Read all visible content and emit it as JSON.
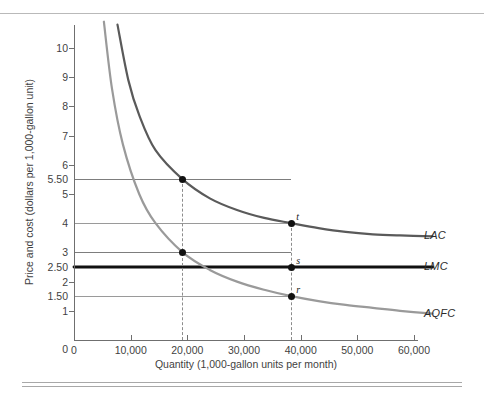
{
  "chart_data": {
    "type": "line",
    "title": "",
    "xlabel": "Quantity (1,000-gallon units per month)",
    "ylabel": "Price and cost (dollars per 1,000-gallon unit)",
    "xlim": [
      0,
      68000
    ],
    "ylim": [
      0,
      10.8
    ],
    "grid": false,
    "legend_position": "right-of-curves",
    "x_ticks": [
      {
        "value": 0,
        "label": "0"
      },
      {
        "value": 10000,
        "label": "10,000"
      },
      {
        "value": 20000,
        "label": "20,000"
      },
      {
        "value": 30000,
        "label": "30,000"
      },
      {
        "value": 40000,
        "label": "40,000"
      },
      {
        "value": 50000,
        "label": "50,000"
      },
      {
        "value": 60000,
        "label": "60,000"
      }
    ],
    "y_ticks": [
      {
        "value": 10,
        "label": "10"
      },
      {
        "value": 9,
        "label": "9"
      },
      {
        "value": 8,
        "label": "8"
      },
      {
        "value": 7,
        "label": "7"
      },
      {
        "value": 6,
        "label": "6"
      },
      {
        "value": 5.5,
        "label": "5.50"
      },
      {
        "value": 5,
        "label": "5"
      },
      {
        "value": 4,
        "label": "4"
      },
      {
        "value": 3,
        "label": "3"
      },
      {
        "value": 2.5,
        "label": "2.50"
      },
      {
        "value": 2,
        "label": "2"
      },
      {
        "value": 1.5,
        "label": "1.50"
      },
      {
        "value": 1,
        "label": "1"
      },
      {
        "value": 0,
        "label": "0"
      }
    ],
    "series": [
      {
        "name": "LAC",
        "label": "LAC",
        "color": "#5a5a5a",
        "style": "solid",
        "kind": "declining-average-cost",
        "points": [
          {
            "x": 8000,
            "y": 10.8
          },
          {
            "x": 10000,
            "y": 8.9
          },
          {
            "x": 12000,
            "y": 7.7
          },
          {
            "x": 15000,
            "y": 6.5
          },
          {
            "x": 20000,
            "y": 5.5
          },
          {
            "x": 25000,
            "y": 4.85
          },
          {
            "x": 30000,
            "y": 4.45
          },
          {
            "x": 35000,
            "y": 4.18
          },
          {
            "x": 40000,
            "y": 4.0
          },
          {
            "x": 45000,
            "y": 3.83
          },
          {
            "x": 50000,
            "y": 3.7
          },
          {
            "x": 55000,
            "y": 3.62
          },
          {
            "x": 60000,
            "y": 3.58
          },
          {
            "x": 66000,
            "y": 3.55
          }
        ]
      },
      {
        "name": "LMC",
        "label": "LMC",
        "color": "#111111",
        "style": "solid-bold",
        "kind": "constant-marginal-cost",
        "constant_value": 2.5,
        "points": [
          {
            "x": 0,
            "y": 2.5
          },
          {
            "x": 66000,
            "y": 2.5
          }
        ]
      },
      {
        "name": "AQFC",
        "label": "AQFC",
        "color": "#9a9a9a",
        "style": "solid",
        "kind": "declining-fixed-cost",
        "points": [
          {
            "x": 5500,
            "y": 10.9
          },
          {
            "x": 7000,
            "y": 8.6
          },
          {
            "x": 9000,
            "y": 6.7
          },
          {
            "x": 12000,
            "y": 5.0
          },
          {
            "x": 15000,
            "y": 4.0
          },
          {
            "x": 20000,
            "y": 3.0
          },
          {
            "x": 25000,
            "y": 2.4
          },
          {
            "x": 30000,
            "y": 2.0
          },
          {
            "x": 35000,
            "y": 1.72
          },
          {
            "x": 40000,
            "y": 1.5
          },
          {
            "x": 45000,
            "y": 1.33
          },
          {
            "x": 50000,
            "y": 1.2
          },
          {
            "x": 55000,
            "y": 1.1
          },
          {
            "x": 60000,
            "y": 1.0
          },
          {
            "x": 66000,
            "y": 0.9
          }
        ]
      }
    ],
    "markers": [
      {
        "id": "m1",
        "label": "",
        "x": 20000,
        "y": 5.5,
        "series": "LAC"
      },
      {
        "id": "m2",
        "label": "",
        "x": 20000,
        "y": 3.0,
        "series": "AQFC"
      },
      {
        "id": "t",
        "label": "t",
        "x": 40000,
        "y": 4.0,
        "series": "LAC"
      },
      {
        "id": "s",
        "label": "s",
        "x": 40000,
        "y": 2.5,
        "series": "LMC"
      },
      {
        "id": "r",
        "label": "r",
        "x": 40000,
        "y": 1.5,
        "series": "AQFC"
      }
    ],
    "reference_lines": {
      "horizontal": [
        {
          "y": 5.5,
          "color": "#7d7d7d",
          "to_x": 40000
        },
        {
          "y": 4.0,
          "color": "#9a9a9a",
          "to_x": 40000
        },
        {
          "y": 3.0,
          "color": "#7d7d7d",
          "to_x": 40000
        },
        {
          "y": 1.5,
          "color": "#9a9a9a",
          "to_x": 40000
        }
      ],
      "vertical_dashed": [
        {
          "x": 20000,
          "from_y": 0,
          "to_y": 5.5
        },
        {
          "x": 40000,
          "from_y": 0,
          "to_y": 4.0
        }
      ]
    }
  }
}
